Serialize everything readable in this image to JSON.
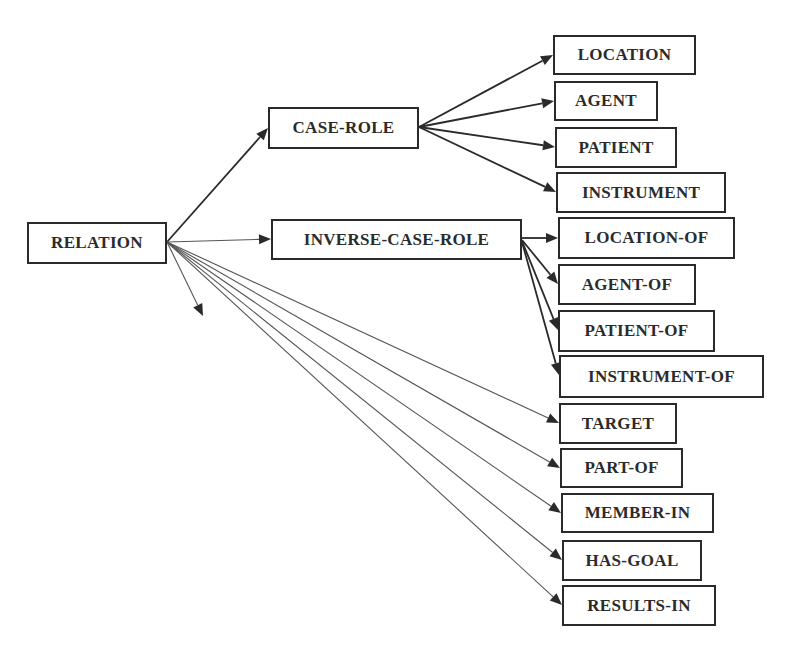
{
  "diagram": {
    "type": "tree",
    "root": "RELATION",
    "nodes": [
      {
        "id": "relation",
        "label": "RELATION",
        "x": 27,
        "y": 222,
        "w": 140,
        "h": 42
      },
      {
        "id": "case-role",
        "label": "CASE-ROLE",
        "x": 268,
        "y": 107,
        "w": 151,
        "h": 42
      },
      {
        "id": "inverse-case-role",
        "label": "INVERSE-CASE-ROLE",
        "x": 271,
        "y": 219,
        "w": 251,
        "h": 41
      },
      {
        "id": "location",
        "label": "LOCATION",
        "x": 553,
        "y": 35,
        "w": 143,
        "h": 40
      },
      {
        "id": "agent",
        "label": "AGENT",
        "x": 554,
        "y": 81,
        "w": 104,
        "h": 40
      },
      {
        "id": "patient",
        "label": "PATIENT",
        "x": 555,
        "y": 127,
        "w": 122,
        "h": 41
      },
      {
        "id": "instrument",
        "label": "INSTRUMENT",
        "x": 556,
        "y": 172,
        "w": 170,
        "h": 41
      },
      {
        "id": "location-of",
        "label": "LOCATION-OF",
        "x": 558,
        "y": 217,
        "w": 177,
        "h": 42
      },
      {
        "id": "agent-of",
        "label": "AGENT-OF",
        "x": 558,
        "y": 264,
        "w": 138,
        "h": 41
      },
      {
        "id": "patient-of",
        "label": "PATIENT-OF",
        "x": 558,
        "y": 310,
        "w": 157,
        "h": 42
      },
      {
        "id": "instrument-of",
        "label": "INSTRUMENT-OF",
        "x": 559,
        "y": 355,
        "w": 205,
        "h": 43
      },
      {
        "id": "target",
        "label": "TARGET",
        "x": 559,
        "y": 403,
        "w": 118,
        "h": 41
      },
      {
        "id": "part-of",
        "label": "PART-OF",
        "x": 560,
        "y": 448,
        "w": 123,
        "h": 40
      },
      {
        "id": "member-in",
        "label": "MEMBER-IN",
        "x": 561,
        "y": 493,
        "w": 153,
        "h": 40
      },
      {
        "id": "has-goal",
        "label": "HAS-GOAL",
        "x": 562,
        "y": 540,
        "w": 140,
        "h": 41
      },
      {
        "id": "results-in",
        "label": "RESULTS-IN",
        "x": 562,
        "y": 585,
        "w": 154,
        "h": 41
      }
    ],
    "edges": [
      {
        "from": [
          167,
          242
        ],
        "to": [
          268,
          128
        ],
        "weight": "bold"
      },
      {
        "from": [
          167,
          242
        ],
        "to": [
          271,
          239
        ],
        "weight": "thin"
      },
      {
        "from": [
          167,
          242
        ],
        "to": [
          203,
          316
        ],
        "weight": "thin"
      },
      {
        "from": [
          167,
          242
        ],
        "to": [
          559,
          423
        ],
        "weight": "thin"
      },
      {
        "from": [
          167,
          242
        ],
        "to": [
          560,
          468
        ],
        "weight": "thin"
      },
      {
        "from": [
          167,
          242
        ],
        "to": [
          561,
          513
        ],
        "weight": "thin"
      },
      {
        "from": [
          167,
          242
        ],
        "to": [
          562,
          560
        ],
        "weight": "thin"
      },
      {
        "from": [
          167,
          242
        ],
        "to": [
          562,
          605
        ],
        "weight": "thin"
      },
      {
        "from": [
          419,
          127
        ],
        "to": [
          553,
          55
        ],
        "weight": "bold"
      },
      {
        "from": [
          419,
          127
        ],
        "to": [
          554,
          101
        ],
        "weight": "bold"
      },
      {
        "from": [
          419,
          127
        ],
        "to": [
          555,
          147
        ],
        "weight": "bold"
      },
      {
        "from": [
          419,
          127
        ],
        "to": [
          556,
          192
        ],
        "weight": "bold"
      },
      {
        "from": [
          522,
          238
        ],
        "to": [
          558,
          238
        ],
        "weight": "bold"
      },
      {
        "from": [
          522,
          240
        ],
        "to": [
          558,
          284
        ],
        "weight": "bold"
      },
      {
        "from": [
          522,
          241
        ],
        "to": [
          558,
          330
        ],
        "weight": "bold"
      },
      {
        "from": [
          522,
          242
        ],
        "to": [
          559,
          375
        ],
        "weight": "bold"
      }
    ]
  },
  "colors": {
    "line": "#2a2a2a",
    "thin_line": "#555555",
    "text": "#2b2b2b",
    "background": "#ffffff"
  }
}
